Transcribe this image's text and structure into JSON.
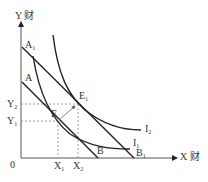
{
  "diagram": {
    "type": "indifference-curve-budget-line",
    "axes": {
      "y_label": "Y 财",
      "x_label": "X 财",
      "origin_label": "0"
    },
    "points": {
      "A": "A",
      "A1": {
        "base": "A",
        "sub": "1"
      },
      "B": "B",
      "B1": {
        "base": "B",
        "sub": "1"
      },
      "E": "E",
      "E1": {
        "base": "E",
        "sub": "1"
      },
      "X1": {
        "base": "X",
        "sub": "1"
      },
      "X2": {
        "base": "X",
        "sub": "2"
      },
      "Y1": {
        "base": "Y",
        "sub": "1"
      },
      "Y2": {
        "base": "Y",
        "sub": "2"
      }
    },
    "curves": {
      "I1": {
        "base": "I",
        "sub": "1"
      },
      "I2": {
        "base": "I",
        "sub": "2"
      }
    },
    "budget_lines": [
      {
        "name": "AB",
        "from": "A",
        "to": "B"
      },
      {
        "name": "A1B1",
        "from": "A1",
        "to": "B1"
      }
    ],
    "equilibria": [
      {
        "point": "E",
        "x": "X1",
        "y": "Y1",
        "curve": "I1",
        "line": "AB"
      },
      {
        "point": "E1",
        "x": "X2",
        "y": "Y2",
        "curve": "I2",
        "line": "A1B1"
      }
    ],
    "arrow": {
      "from": "E",
      "to": "E1"
    },
    "colors": {
      "line": "#222222",
      "dashed": "#777777",
      "text": "#333333"
    }
  }
}
